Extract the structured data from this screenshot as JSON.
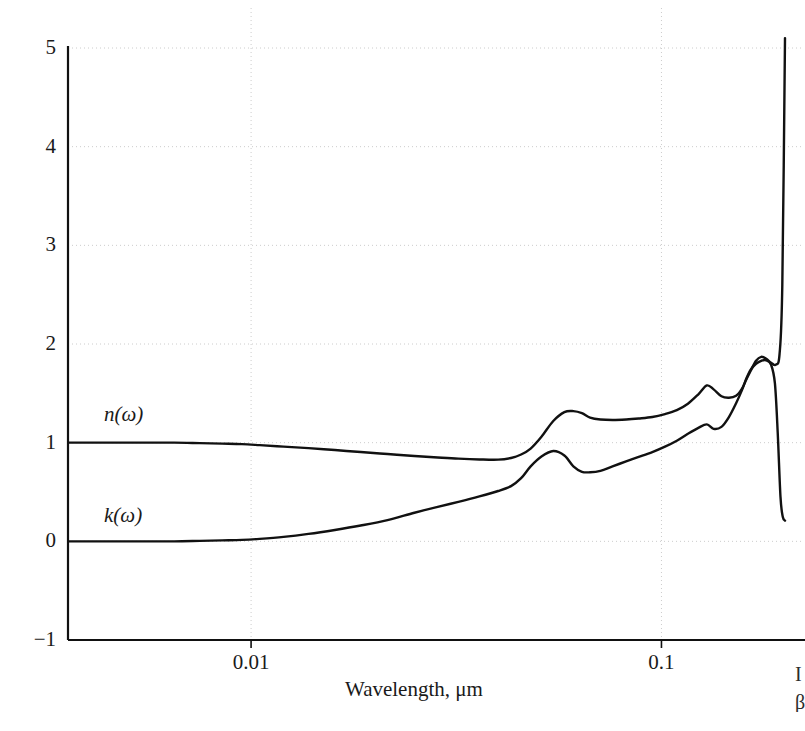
{
  "figure": {
    "background_color": "#ffffff",
    "ink_color": "#111111",
    "grid_color": "#cccccc",
    "width": 805,
    "height": 731
  },
  "axes": {
    "y_ticks": [
      "5",
      "4",
      "3",
      "2",
      "1",
      "0",
      "-1"
    ],
    "y_tick_values": [
      5,
      4,
      3,
      2,
      1,
      0,
      -1
    ],
    "x_ticks": [
      "0.01",
      "0.1"
    ],
    "x_tick_values": [
      0.01,
      0.1
    ],
    "x_title": "Wavelength, μm",
    "y_title": ""
  },
  "curve_labels": {
    "n": "n(ω)",
    "k": "k(ω)"
  },
  "edge_text": {
    "top_fragment": "I",
    "bottom_fragment": "β"
  },
  "chart_data": {
    "type": "line",
    "title": "",
    "xlabel": "Wavelength, μm",
    "ylabel": "",
    "xscale": "log",
    "yscale": "linear",
    "xlim": [
      0.00358,
      0.2
    ],
    "ylim": [
      -1,
      5
    ],
    "grid": true,
    "grid_y_values": [
      0,
      1,
      2,
      3,
      4,
      5
    ],
    "grid_x_values": [
      0.01,
      0.1
    ],
    "legend": "inline-labels",
    "legend_position": "inside-left",
    "series": [
      {
        "name": "n(ω)",
        "label": "n(ω)",
        "color": "#111111",
        "x": [
          0.00358,
          0.0045,
          0.0055,
          0.0065,
          0.0075,
          0.0085,
          0.0095,
          0.0105,
          0.012,
          0.0138,
          0.016,
          0.0185,
          0.0215,
          0.025,
          0.0285,
          0.032,
          0.036,
          0.04,
          0.043,
          0.0455,
          0.048,
          0.051,
          0.0545,
          0.058,
          0.061,
          0.064,
          0.067,
          0.071,
          0.076,
          0.082,
          0.088,
          0.095,
          0.102,
          0.109,
          0.116,
          0.123,
          0.129,
          0.134,
          0.14,
          0.146,
          0.152,
          0.157,
          0.161,
          0.165,
          0.17,
          0.175,
          0.18,
          0.185,
          0.19,
          0.194,
          0.197,
          0.2
        ],
        "y": [
          1.0,
          1.0,
          1.0,
          1.0,
          0.995,
          0.99,
          0.985,
          0.975,
          0.96,
          0.945,
          0.925,
          0.905,
          0.885,
          0.865,
          0.85,
          0.838,
          0.83,
          0.828,
          0.845,
          0.88,
          0.94,
          1.06,
          1.22,
          1.31,
          1.32,
          1.3,
          1.255,
          1.235,
          1.23,
          1.235,
          1.245,
          1.26,
          1.29,
          1.33,
          1.395,
          1.49,
          1.58,
          1.54,
          1.47,
          1.455,
          1.475,
          1.545,
          1.64,
          1.73,
          1.83,
          1.87,
          1.85,
          1.81,
          1.79,
          1.9,
          2.6,
          5.1
        ]
      },
      {
        "name": "k(ω)",
        "label": "k(ω)",
        "color": "#111111",
        "x": [
          0.00358,
          0.0045,
          0.0055,
          0.0065,
          0.0075,
          0.0085,
          0.0095,
          0.0105,
          0.012,
          0.0138,
          0.016,
          0.0185,
          0.0215,
          0.025,
          0.0285,
          0.032,
          0.036,
          0.04,
          0.043,
          0.0455,
          0.048,
          0.051,
          0.0545,
          0.058,
          0.061,
          0.064,
          0.067,
          0.071,
          0.076,
          0.082,
          0.088,
          0.095,
          0.102,
          0.109,
          0.116,
          0.123,
          0.129,
          0.134,
          0.14,
          0.146,
          0.152,
          0.157,
          0.161,
          0.165,
          0.17,
          0.175,
          0.18,
          0.185,
          0.189,
          0.192,
          0.195,
          0.1975,
          0.2
        ],
        "y": [
          0.0,
          0.0,
          0.0,
          0.0,
          0.005,
          0.01,
          0.015,
          0.025,
          0.045,
          0.075,
          0.115,
          0.16,
          0.215,
          0.29,
          0.35,
          0.4,
          0.455,
          0.51,
          0.56,
          0.64,
          0.76,
          0.86,
          0.915,
          0.87,
          0.76,
          0.705,
          0.7,
          0.715,
          0.76,
          0.81,
          0.855,
          0.905,
          0.96,
          1.02,
          1.09,
          1.15,
          1.185,
          1.14,
          1.16,
          1.26,
          1.4,
          1.53,
          1.65,
          1.74,
          1.8,
          1.83,
          1.835,
          1.79,
          1.6,
          1.1,
          0.45,
          0.25,
          0.21
        ]
      }
    ]
  }
}
